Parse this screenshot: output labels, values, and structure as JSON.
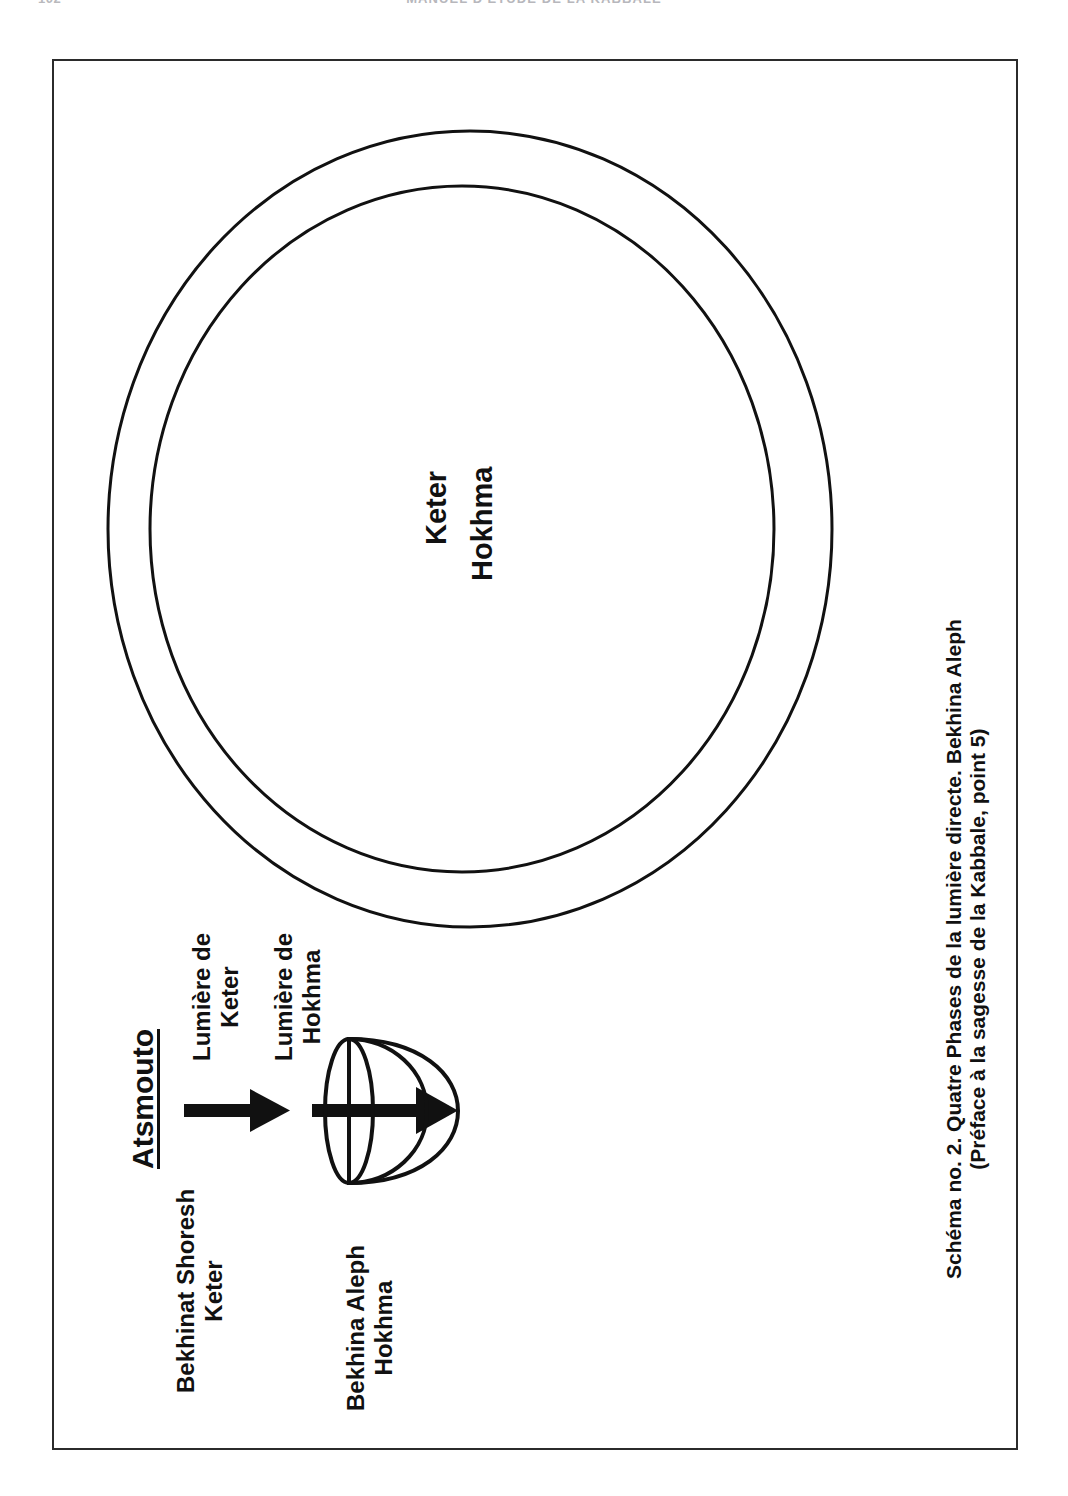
{
  "page": {
    "folio": "102",
    "running_head": "MANUEL D'ETUDE DE LA KABBALE"
  },
  "figure": {
    "circles": {
      "outer_label": "Keter",
      "inner_label": "Hokhma"
    },
    "source_label": "Atsmouto",
    "arrows": [
      {
        "name": "arrow-keter",
        "label": "Lumière de Keter",
        "origin_label": "Bekhinat Shoresh\nKeter"
      },
      {
        "name": "arrow-hokhma",
        "label": "Lumière de Hokhma",
        "origin_label": "Bekhina Aleph\nHokhma"
      }
    ],
    "light_keter_label_line1": "Lumière de",
    "light_keter_label_line2": "Keter",
    "light_hokhma_label_line1": "Lumière de",
    "light_hokhma_label_line2": "Hokhma",
    "bekhinat_shoresh_line1": "Bekhinat Shoresh",
    "bekhinat_shoresh_line2": "Keter",
    "bekhina_aleph_line1": "Bekhina Aleph",
    "bekhina_aleph_line2": "Hokhma",
    "vessel_name": "dome-vessel-shape",
    "caption_line1": "Schéma no. 2. Quatre Phases de la lumière directe. Bekhina Aleph",
    "caption_line2": "(Préface à la sagesse de la Kabbale, point 5)"
  },
  "colors": {
    "ink": "#111111",
    "frame": "#2b2b2b",
    "paper": "#ffffff",
    "faded_header": "#b7b7bc"
  }
}
